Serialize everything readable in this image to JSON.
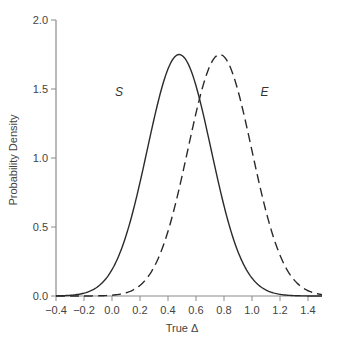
{
  "chart_data": {
    "type": "line",
    "title": "",
    "xlabel": "True Δ",
    "ylabel": "Probability Density",
    "xlim": [
      -0.4,
      1.5
    ],
    "ylim": [
      0.0,
      2.0
    ],
    "xticks": [
      "-0.4",
      "-0.2",
      "0.0",
      "0.2",
      "0.4",
      "0.6",
      "0.8",
      "1.0",
      "1.2",
      "1.4"
    ],
    "xtick_values": [
      -0.4,
      -0.2,
      0.0,
      0.2,
      0.4,
      0.6,
      0.8,
      1.0,
      1.2,
      1.4
    ],
    "yticks": [
      "0.0",
      "0.5",
      "1.0",
      "1.5",
      "2.0"
    ],
    "ytick_values": [
      0.0,
      0.5,
      1.0,
      1.5,
      2.0
    ],
    "grid": false,
    "legend": "inline labels",
    "series": [
      {
        "name": "S",
        "style": "solid",
        "distribution": "normal",
        "mean": 0.48,
        "sd": 0.228,
        "peak_density": 1.75,
        "label_position": [
          0.05,
          1.45
        ]
      },
      {
        "name": "E",
        "style": "dashed",
        "distribution": "normal",
        "mean": 0.77,
        "sd": 0.228,
        "peak_density": 1.75,
        "label_position": [
          1.09,
          1.45
        ]
      }
    ]
  }
}
